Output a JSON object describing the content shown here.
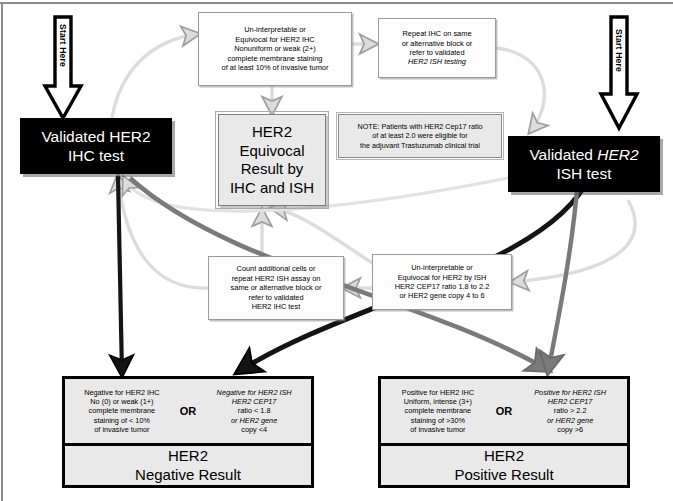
{
  "diagram": {
    "colors": {
      "terminator_fill": "#000000",
      "terminator_text": "#ffffff",
      "process_fill": "#fdfdfd",
      "result_fill": "#e9e9e9",
      "equivocal_fill": "#e9e9e9",
      "arrow_light": "#d9d9d9",
      "arrow_mid": "#7a7a7a",
      "arrow_dark": "#1a1a1a"
    }
  },
  "start_left": {
    "label": "Start Here"
  },
  "start_right": {
    "label": "Start Here"
  },
  "ihc_test": {
    "line1": "Validated HER2",
    "line2": "IHC test"
  },
  "ish_test": {
    "line1": "Validated ",
    "line1_italic": "HER2",
    "line2": "ISH test"
  },
  "ihc_equivocal": {
    "lines": [
      "Un-interpretable or",
      "Equivocal for HER2 IHC",
      "Nonuniform or weak (2+)",
      "complete membrane staining",
      "of at least 10% of invasive tumor"
    ]
  },
  "repeat_ihc": {
    "lines": [
      "Repeat IHC on same",
      "or alternative block or",
      "refer to validated",
      "HER2 ISH testing"
    ],
    "italic_token": "HER2"
  },
  "equivocal_result": {
    "lines": [
      "HER2",
      "Equivocal",
      "Result by",
      "IHC and ISH"
    ]
  },
  "note": {
    "lines": [
      "NOTE: Patients with HER2 Cep17 ratio",
      "of at least 2.0 were eligible for",
      "the adjuvant Trastuzumab clinical trial"
    ]
  },
  "count_cells": {
    "lines": [
      "Count additional cells or",
      "repeat HER2 ISH assay on",
      "same or alternative block or",
      "refer to validated",
      "HER2 IHC test"
    ]
  },
  "ish_equivocal": {
    "lines": [
      "Un-interpretable or",
      "Equivocal for HER2 by ISH",
      "HER2 CEP17 ratio 1.8 to 2.2",
      "or HER2 gene copy 4 to 6"
    ]
  },
  "negative_result": {
    "ihc_criteria": [
      "Negative for HER2 IHC",
      "No (0) or weak (1+)",
      "complete membrane",
      "staining of < 10%",
      "of invasive tumor"
    ],
    "or_label": "OR",
    "ish_criteria": [
      "Negative for HER2 ISH",
      "HER2 CEP17",
      "ratio < 1.8",
      "or HER2 gene",
      "copy <4"
    ],
    "verdict_line1": "HER2",
    "verdict_line2": "Negative Result"
  },
  "positive_result": {
    "ihc_criteria": [
      "Positive for HER2 IHC",
      "Uniform, intense (3+)",
      "complete membrane",
      "staining of >30%",
      "of invasive tumor"
    ],
    "or_label": "OR",
    "ish_criteria": [
      "Positive for HER2 ISH",
      "HER2 CEP17",
      "ratio > 2.2",
      "or HER2 gene",
      "copy >6"
    ],
    "verdict_line1": "HER2",
    "verdict_line2": "Positive Result"
  }
}
